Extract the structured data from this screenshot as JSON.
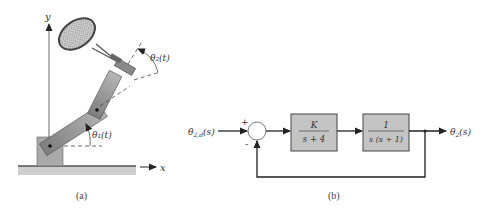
{
  "figure_a": {
    "caption": "(a)",
    "axis_x_label": "x",
    "axis_y_label": "y",
    "theta1_label": "θ₁(t)",
    "theta2_label": "θ₂(t)",
    "colors": {
      "arm": "#9a9a9a",
      "base": "#a8a8a8",
      "ground": "#c8c8c8",
      "racket": "#555555"
    }
  },
  "figure_b": {
    "caption": "(b)",
    "input_label": "θ2,d(s)",
    "output_label": "θ2(s)",
    "summing_junction": {
      "plus": "+",
      "minus": "-"
    },
    "blocks": [
      {
        "numerator": "K",
        "denominator": "s + 4"
      },
      {
        "numerator": "1",
        "denominator": "s (s + 1)"
      }
    ],
    "colors": {
      "block_fill": "#c4c4c4",
      "block_stroke": "#444444",
      "line": "#222222"
    }
  }
}
